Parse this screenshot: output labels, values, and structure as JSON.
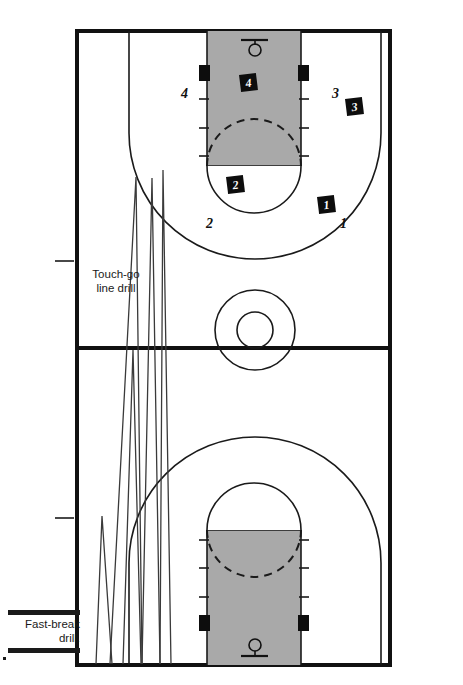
{
  "figure": {
    "court": {
      "outline_color": "#111111",
      "paint_color": "#a9a9a9",
      "line_color": "#1a1a1a",
      "background": "#ffffff"
    },
    "annotations": {
      "touch_go": "Touch-go\nline drill",
      "touch_go_line1": "Touch-go",
      "touch_go_line2": "line drill",
      "fast_break": "Fast-break\ndrill.",
      "fast_break_line1": "Fast-break",
      "fast_break_line2": "drill."
    },
    "court_labels": [
      {
        "name": "label-4-left",
        "text": "4",
        "x": 181,
        "y": 86
      },
      {
        "name": "label-3-right",
        "text": "3",
        "x": 332,
        "y": 86
      },
      {
        "name": "label-2-bottom",
        "text": "2",
        "x": 206,
        "y": 216
      },
      {
        "name": "label-1-right",
        "text": "1",
        "x": 340,
        "y": 216
      }
    ],
    "player_chips": [
      {
        "name": "chip-4",
        "text": "4",
        "x": 240,
        "y": 74
      },
      {
        "name": "chip-3",
        "text": "3",
        "x": 346,
        "y": 98
      },
      {
        "name": "chip-2",
        "text": "2",
        "x": 227,
        "y": 176
      },
      {
        "name": "chip-1",
        "text": "1",
        "x": 318,
        "y": 196
      }
    ],
    "hoops": [
      {
        "name": "hoop-top",
        "position": "top"
      },
      {
        "name": "hoop-bottom",
        "position": "bottom"
      }
    ],
    "drill_paths": {
      "touch_go_name": "touch-go-zigzag-path",
      "fast_break_name": "fast-break-zigzag-path"
    }
  }
}
